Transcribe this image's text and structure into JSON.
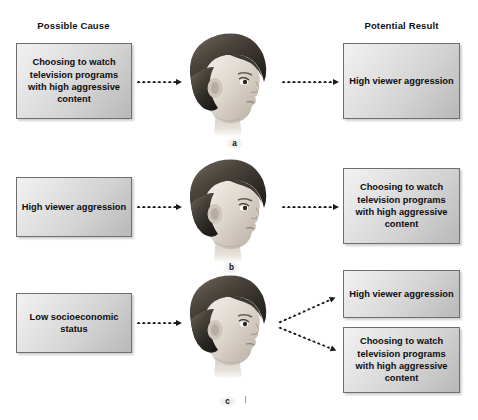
{
  "headers": {
    "left": "Possible Cause",
    "right": "Potential Result"
  },
  "text": {
    "tv_choice": "Choosing to watch television programs with high aggressive content",
    "aggression": "High viewer aggression",
    "ses": "Low socioeconomic status"
  },
  "rows": [
    {
      "label": "a",
      "cause": "Choosing to watch television programs with high aggressive content",
      "results": [
        "High viewer aggression"
      ]
    },
    {
      "label": "b",
      "cause": "High viewer aggression",
      "results": [
        "Choosing to watch television programs with high aggressive content"
      ]
    },
    {
      "label": "c",
      "cause": "Low socioeconomic status",
      "results": [
        "High viewer aggression",
        "Choosing to watch television programs with high aggressive content"
      ]
    }
  ],
  "illustration": {
    "name": "child-head-profile",
    "description": "Grayscale pencil illustration of a child's head in right-facing profile"
  },
  "colors": {
    "background": "#ffffff",
    "box_border": "#6e6e6e",
    "box_fill_light": "#f2f2f2",
    "box_fill_dark": "#b8b8b8",
    "arrow": "#1a1a1a",
    "text": "#111111"
  }
}
